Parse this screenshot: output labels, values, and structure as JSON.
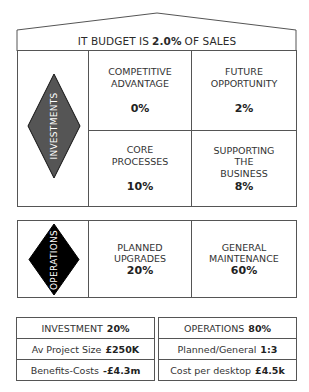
{
  "title": {
    "prefix": "IT BUDGET IS",
    "value": "2.0%",
    "suffix": "OF SALES"
  },
  "investments": {
    "label": "INVESTMENTS",
    "diamond_color": "#555555",
    "quadrants": [
      {
        "name": "competitive-advantage",
        "line1": "COMPETITIVE",
        "line2": "ADVANTAGE",
        "line3": "",
        "value": "0%"
      },
      {
        "name": "future-opportunity",
        "line1": "FUTURE",
        "line2": "OPPORTUNITY",
        "line3": "",
        "value": "2%"
      },
      {
        "name": "core-processes",
        "line1": "CORE",
        "line2": "PROCESSES",
        "line3": "",
        "value": "10%"
      },
      {
        "name": "supporting-the-business",
        "line1": "SUPPORTING",
        "line2": "THE",
        "line3": "BUSINESS",
        "value": "8%"
      }
    ]
  },
  "operations": {
    "label": "OPERATIONS",
    "diamond_color": "#000000",
    "cells": [
      {
        "name": "planned-upgrades",
        "line1": "PLANNED",
        "line2": "UPGRADES",
        "value": "20%"
      },
      {
        "name": "general-maintenance",
        "line1": "GENERAL",
        "line2": "MAINTENANCE",
        "value": "60%"
      }
    ]
  },
  "summary": {
    "left": [
      {
        "label": "INVESTMENT",
        "value": "20%"
      },
      {
        "label": "Av Project Size",
        "value": "£250K"
      },
      {
        "label": "Benefits-Costs",
        "value": "-£4.3m"
      }
    ],
    "right": [
      {
        "label": "OPERATIONS",
        "value": "80%"
      },
      {
        "label": "Planned/General",
        "value": "1:3"
      },
      {
        "label": "Cost per desktop",
        "value": "£4.5k"
      }
    ]
  }
}
